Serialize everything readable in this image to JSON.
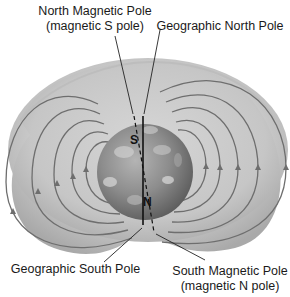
{
  "diagram": {
    "labels": {
      "north_magnetic_pole": {
        "line1": "North Magnetic Pole",
        "line2": "(magnetic S pole)"
      },
      "geographic_north_pole": "Geographic North Pole",
      "geographic_south_pole": "Geographic South Pole",
      "south_magnetic_pole": {
        "line1": "South Magnetic Pole",
        "line2": "(magnetic N pole)"
      }
    },
    "globe_markers": {
      "magnetic_s": "S",
      "magnetic_n": "N"
    },
    "colors": {
      "envelope_fill": "#c9c9c9",
      "envelope_shade": "#b0b0b0",
      "field_line": "#6e6e6e",
      "globe_base": "#8a8a8a",
      "axis_line": "#111111",
      "text": "#1a1a1a"
    },
    "field_lines": {
      "per_side": 5,
      "left_direction": "down",
      "right_direction": "up"
    }
  }
}
